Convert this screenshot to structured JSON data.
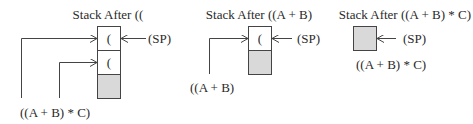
{
  "panels": [
    {
      "title": "Stack After ((",
      "cells": [
        "(",
        "("
      ],
      "has_shaded_base": true,
      "sp_label": "(SP)",
      "input_label": "((A + B) * C)"
    },
    {
      "title": "Stack After ((A + B)",
      "cells": [
        "("
      ],
      "has_shaded_base": true,
      "sp_label": "(SP)",
      "input_label": "((A + B)"
    },
    {
      "title": "Stack After ((A + B) * C)",
      "cells": [],
      "has_shaded_base": true,
      "sp_label": "(SP)",
      "input_label": "((A + B) * C)"
    }
  ],
  "colors": {
    "shade": "#d9d9d9",
    "line": "#444444"
  }
}
